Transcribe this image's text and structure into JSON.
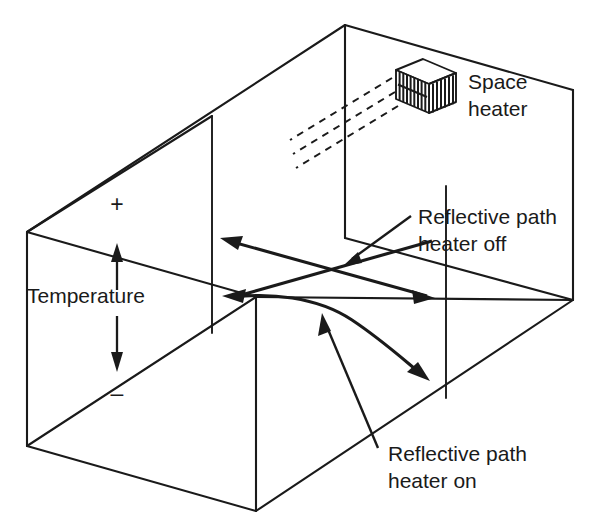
{
  "diagram": {
    "title": "Reflective acoustic path in a room with a space heater",
    "background_color": "#ffffff",
    "line_color": "#1a1a1a",
    "canvas": {
      "width": 596,
      "height": 527
    }
  },
  "labels": {
    "space_heater": {
      "line1": "Space",
      "line2": "heater"
    },
    "reflective_path_off": {
      "line1": "Reflective path",
      "line2": "heater off"
    },
    "reflective_path_on": {
      "line1": "Reflective path",
      "line2": "heater on"
    },
    "temperature_axis": {
      "name": "Temperature",
      "positive_sign": "+",
      "negative_sign": "–"
    }
  },
  "objects": {
    "room": {
      "name": "room-enclosure",
      "shape": "rectangular-box-isometric",
      "visible_edges": 12
    },
    "heater": {
      "name": "space-heater",
      "shape": "box-with-vertical-grille",
      "grille_bar_count": 9,
      "mounted_on": "back-right-wall"
    },
    "heat_rays": {
      "name": "radiant-heat-rays",
      "style": "dashed",
      "count": 3,
      "direction": "down-and-left-from-heater"
    },
    "straight_path": {
      "name": "reflective-path-heater-off",
      "style": "double-headed-straight-arrow",
      "description": "Straight sound path with heater off"
    },
    "curved_path": {
      "name": "reflective-path-heater-on",
      "style": "double-headed-curved-arrow",
      "description": "Refracted sound path with heater on"
    }
  }
}
